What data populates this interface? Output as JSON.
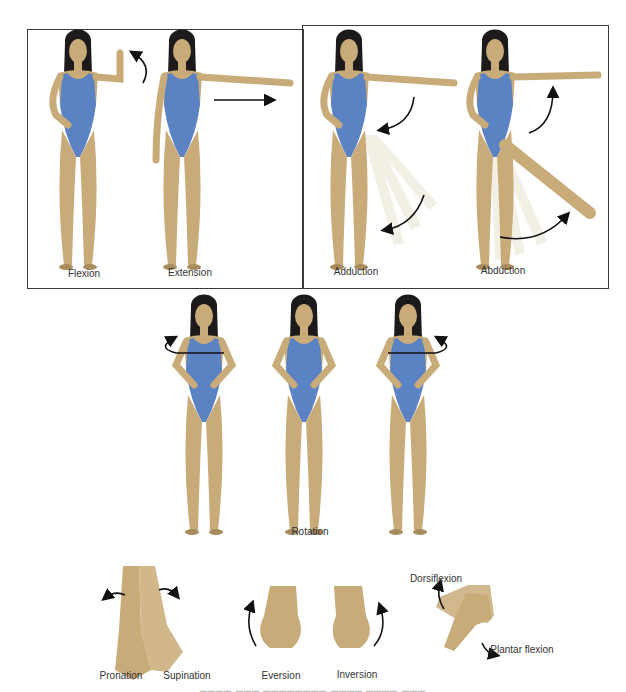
{
  "panels": {
    "top_left": {
      "figures": [
        {
          "label": "Flexion",
          "arrow": "curved-up-left"
        },
        {
          "label": "Extension",
          "arrow": "straight-right"
        }
      ]
    },
    "top_right": {
      "figures": [
        {
          "label": "Adduction",
          "arrow": "curved-inward"
        },
        {
          "label": "Abduction",
          "arrow": "curved-outward"
        }
      ]
    },
    "middle": {
      "label": "Rotation",
      "figures": [
        {
          "pose": "rotated-left"
        },
        {
          "pose": "neutral"
        },
        {
          "pose": "rotated-right"
        }
      ]
    },
    "bottom": {
      "items": [
        {
          "label": "Pronation"
        },
        {
          "label": "Supination"
        },
        {
          "label": "Eversion"
        },
        {
          "label": "Inversion"
        },
        {
          "label": "Dorsiflexion"
        },
        {
          "label": "Plantar flexion"
        }
      ]
    }
  },
  "colors": {
    "swimsuit": "#5b83c4",
    "skin": "#c9ab7a",
    "skin_shadow": "#a88c5e",
    "hair": "#1c1a1a",
    "arrow": "#111111",
    "frame": "#3a3a3a",
    "ghost_leg": "#e8e2cf"
  }
}
